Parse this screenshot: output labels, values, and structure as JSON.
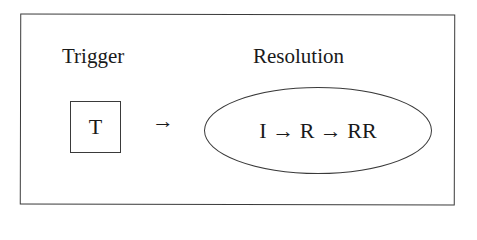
{
  "diagram": {
    "trigger": {
      "heading": "Trigger",
      "box_label": "T"
    },
    "connector": "→",
    "resolution": {
      "heading": "Resolution",
      "sequence": "I → R → RR"
    }
  }
}
